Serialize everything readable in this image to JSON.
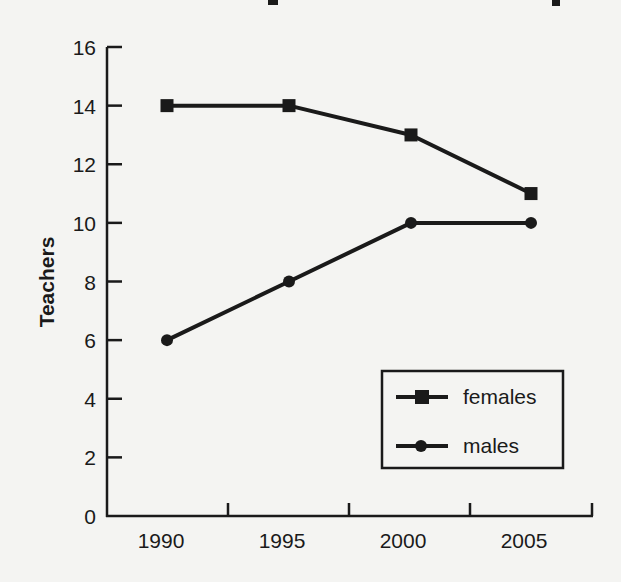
{
  "chart_data": {
    "type": "line",
    "title": "",
    "xlabel": "",
    "ylabel": "Teachers",
    "categories": [
      "1990",
      "1995",
      "2000",
      "2005"
    ],
    "series": [
      {
        "name": "females",
        "marker": "square",
        "values": [
          14,
          14,
          13,
          11
        ]
      },
      {
        "name": "males",
        "marker": "circle",
        "values": [
          6,
          8,
          10,
          10
        ]
      }
    ],
    "ylim": [
      0,
      16
    ],
    "yticks": [
      0,
      2,
      4,
      6,
      8,
      10,
      12,
      14,
      16
    ],
    "grid": false,
    "legend_position": "lower right",
    "colors": {
      "line": "#1a1a1a",
      "background": "#f4f4f2"
    }
  },
  "axes": {
    "y_title": "Teachers",
    "y_ticks": [
      "0",
      "2",
      "4",
      "6",
      "8",
      "10",
      "12",
      "14",
      "16"
    ],
    "x_ticks": [
      "1990",
      "1995",
      "2000",
      "2005"
    ]
  },
  "legend": {
    "items": [
      {
        "label": "females",
        "icon": "square-marker-icon"
      },
      {
        "label": "males",
        "icon": "circle-marker-icon"
      }
    ]
  }
}
